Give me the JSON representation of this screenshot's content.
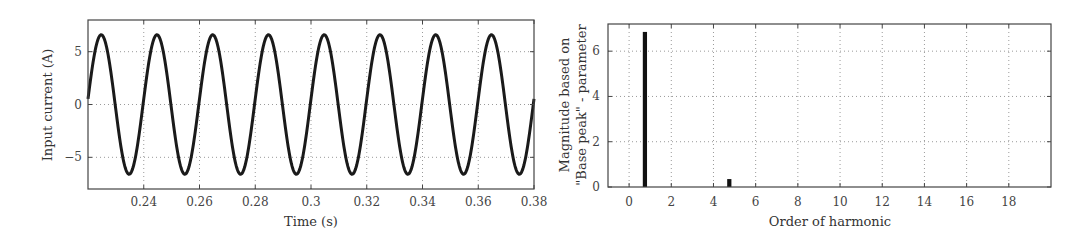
{
  "chart_data": [
    {
      "type": "line",
      "title": "",
      "xlabel": "Time (s)",
      "ylabel": "Input current (A)",
      "xlim": [
        0.22,
        0.38
      ],
      "ylim": [
        -8,
        8
      ],
      "xticks": [
        0.24,
        0.26,
        0.28,
        0.3,
        0.32,
        0.34,
        0.36,
        0.38
      ],
      "xtick_labels": [
        "0.24",
        "0.26",
        "0.28",
        "0.3",
        "0.32",
        "0.34",
        "0.36",
        "0.38"
      ],
      "yticks": [
        -5,
        0,
        5
      ],
      "ytick_labels": [
        "−5",
        "0",
        "5"
      ],
      "grid": true,
      "legend": null,
      "series": [
        {
          "name": "Input current",
          "color": "#1a1a1a",
          "function": "6.6*sin(2*pi*50*(t-0.22)+0.08)",
          "amplitude": 6.6,
          "frequency_hz": 50,
          "period_s": 0.02,
          "x": [
            0.22,
            0.225,
            0.23,
            0.235,
            0.24,
            0.245,
            0.25,
            0.255,
            0.26,
            0.265,
            0.27,
            0.275,
            0.28,
            0.285,
            0.29,
            0.295,
            0.3,
            0.305,
            0.31,
            0.315,
            0.32,
            0.325,
            0.33,
            0.335,
            0.34,
            0.345,
            0.35,
            0.355,
            0.36,
            0.365,
            0.37,
            0.375,
            0.38
          ],
          "values": [
            0.5,
            6.6,
            -0.5,
            -6.6,
            0.5,
            6.6,
            -0.5,
            -6.6,
            0.5,
            6.6,
            -0.5,
            -6.6,
            0.5,
            6.6,
            -0.5,
            -6.6,
            0.5,
            6.6,
            -0.5,
            -6.6,
            0.5,
            6.6,
            -0.5,
            -6.6,
            0.5,
            6.6,
            -0.5,
            -6.6,
            0.5,
            6.6,
            -0.5,
            -6.6,
            0.5
          ]
        }
      ]
    },
    {
      "type": "bar",
      "title": "",
      "xlabel": "Order of harmonic",
      "ylabel": "Magnitude based on \"Base peak\" - parameter",
      "ylabel_lines": [
        "Magnitude based on",
        "\"Base peak\" - parameter"
      ],
      "xlim": [
        -1,
        20
      ],
      "ylim": [
        0,
        7.2
      ],
      "xticks": [
        0,
        2,
        4,
        6,
        8,
        10,
        12,
        14,
        16,
        18
      ],
      "xtick_labels": [
        "0",
        "2",
        "4",
        "6",
        "8",
        "10",
        "12",
        "14",
        "16",
        "18"
      ],
      "yticks": [
        0,
        2,
        4,
        6
      ],
      "ytick_labels": [
        "0",
        "2",
        "4",
        "6"
      ],
      "grid": true,
      "legend": null,
      "categories": [
        0.75,
        4.75
      ],
      "values": [
        6.85,
        0.35
      ],
      "bar_width": 0.2,
      "color": "#111111"
    }
  ]
}
